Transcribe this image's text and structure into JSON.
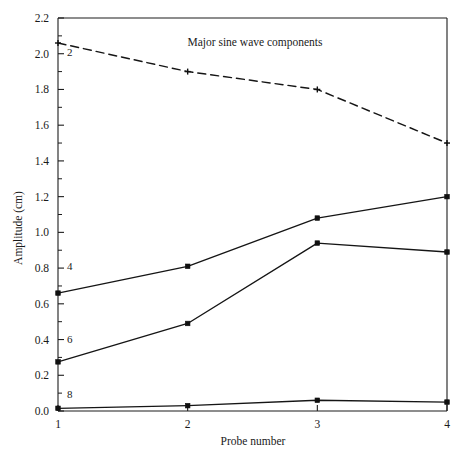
{
  "chart_data": {
    "type": "line",
    "title": "Major sine wave components",
    "xlabel": "Probe number",
    "ylabel": "Amplitude (cm)",
    "x": [
      1,
      2,
      3,
      4
    ],
    "xticklabels": [
      "1",
      "2",
      "3",
      "4"
    ],
    "xlim": [
      1,
      4
    ],
    "ylim": [
      0.0,
      2.2
    ],
    "yticklabels": [
      "0.0",
      "0.2",
      "0.4",
      "0.6",
      "0.8",
      "1.0",
      "1.2",
      "1.4",
      "1.6",
      "1.8",
      "2.0",
      "2.2"
    ],
    "ytickvalues": [
      0.0,
      0.2,
      0.4,
      0.6,
      0.8,
      1.0,
      1.2,
      1.4,
      1.6,
      1.8,
      2.0,
      2.2
    ],
    "grid": false,
    "legend_position": "inline-labels",
    "series": [
      {
        "name": "2",
        "label": "2",
        "style": "dashed",
        "marker": "plus",
        "values": [
          2.06,
          1.9,
          1.8,
          1.5
        ],
        "label_x": 1.09,
        "label_y": 1.99
      },
      {
        "name": "4",
        "label": "4",
        "style": "solid",
        "marker": "square",
        "values": [
          0.66,
          0.81,
          1.08,
          1.2
        ],
        "label_x": 1.09,
        "label_y": 0.79
      },
      {
        "name": "6",
        "label": "6",
        "style": "solid",
        "marker": "square",
        "values": [
          0.275,
          0.49,
          0.94,
          0.89
        ],
        "label_x": 1.09,
        "label_y": 0.38
      },
      {
        "name": "8",
        "label": "8",
        "style": "solid",
        "marker": "square",
        "values": [
          0.015,
          0.03,
          0.06,
          0.05
        ],
        "label_x": 1.09,
        "label_y": 0.075
      }
    ]
  }
}
